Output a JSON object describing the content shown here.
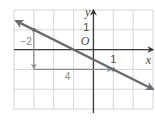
{
  "chart_data": {
    "type": "line",
    "title": "",
    "xlabel": "x",
    "ylabel": "y",
    "origin_label": "O",
    "xlim": [
      -4,
      3
    ],
    "ylim": [
      -3,
      2
    ],
    "grid": true,
    "x_tick_labels": [
      {
        "value": 1,
        "label": "1"
      }
    ],
    "y_tick_labels": [
      {
        "value": 1,
        "label": "1"
      }
    ],
    "series": [
      {
        "name": "line",
        "slope": -0.5,
        "intercept": -0.5,
        "points": [
          {
            "x": -3,
            "y": 1
          },
          {
            "x": 1,
            "y": -1
          }
        ],
        "arrows": "both",
        "color": "#6a6e72"
      }
    ],
    "slope_triangle": {
      "start": {
        "x": -3,
        "y": 1
      },
      "corner": {
        "x": -3,
        "y": -1
      },
      "end": {
        "x": 1,
        "y": -1
      },
      "rise_label": "−2",
      "run_label": "4",
      "color": "#8a8e92"
    }
  }
}
